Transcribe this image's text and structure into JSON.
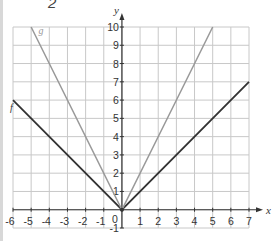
{
  "top_label": "2",
  "chart_data": {
    "type": "line",
    "title": "",
    "xlabel": "x",
    "ylabel": "y",
    "xlim": [
      -6,
      7
    ],
    "ylim": [
      -1,
      10
    ],
    "grid": true,
    "x_ticks": [
      "-6",
      "-5",
      "-4",
      "-3",
      "-2",
      "-1",
      "0",
      "1",
      "2",
      "3",
      "4",
      "5",
      "6",
      "7"
    ],
    "y_ticks": [
      "-1",
      "1",
      "2",
      "3",
      "4",
      "5",
      "6",
      "7",
      "8",
      "9",
      "10"
    ],
    "series": [
      {
        "name": "f",
        "color": "#333333",
        "points": [
          [
            -6,
            6
          ],
          [
            0,
            0
          ],
          [
            7,
            7
          ]
        ],
        "equation": "f(x) = |x|"
      },
      {
        "name": "g",
        "color": "#999999",
        "points": [
          [
            -5,
            10
          ],
          [
            0,
            0
          ],
          [
            5,
            10
          ]
        ],
        "equation": "g(x) = 2|x|"
      }
    ],
    "legend": []
  }
}
